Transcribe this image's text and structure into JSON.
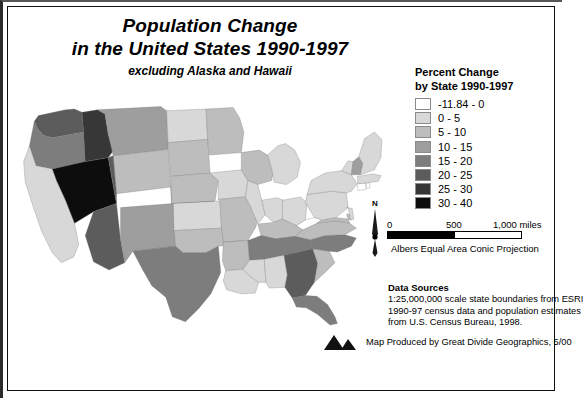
{
  "title": {
    "line1": "Population Change",
    "line2": "in the United States 1990-1997",
    "subtitle": "excluding Alaska and Hawaii"
  },
  "legend": {
    "title_line1": "Percent Change",
    "title_line2": "by State 1990-1997",
    "classes": [
      {
        "label": "-11.84 - 0",
        "color": "#ffffff"
      },
      {
        "label": "0 - 5",
        "color": "#d8d8d8"
      },
      {
        "label": "5 - 10",
        "color": "#bdbdbd"
      },
      {
        "label": "10 - 15",
        "color": "#9e9e9e"
      },
      {
        "label": "15 - 20",
        "color": "#7d7d7d"
      },
      {
        "label": "20 - 25",
        "color": "#5c5c5c"
      },
      {
        "label": "25 - 30",
        "color": "#373737"
      },
      {
        "label": "30 - 40",
        "color": "#0d0d0d"
      }
    ]
  },
  "north_arrow": {
    "label": "N"
  },
  "scalebar": {
    "tick_0": "0",
    "tick_mid": "500",
    "tick_max": "1,000 miles",
    "projection": "Albers Equal Area Conic Projection"
  },
  "data_sources": {
    "heading": "Data Sources",
    "line1": "1:25,000,000 scale state boundaries from ESRI",
    "line2": "1990-97 census data and population estimates",
    "line3": "from U.S. Census Bureau, 1998."
  },
  "credit": {
    "text": "Map Produced by Great Divide Geographics, 5/00"
  },
  "chart_data": {
    "type": "map",
    "title": "Population Change in the United States 1990-1997",
    "subtitle": "excluding Alaska and Hawaii",
    "unit": "percent change",
    "classes": [
      "-11.84 - 0",
      "0 - 5",
      "5 - 10",
      "10 - 15",
      "15 - 20",
      "20 - 25",
      "25 - 30",
      "30 - 40"
    ],
    "class_colors": [
      "#ffffff",
      "#d8d8d8",
      "#bdbdbd",
      "#9e9e9e",
      "#7d7d7d",
      "#5c5c5c",
      "#373737",
      "#0d0d0d"
    ],
    "states": [
      {
        "code": "WA",
        "name": "Washington",
        "class": 5,
        "color": "#5c5c5c"
      },
      {
        "code": "OR",
        "name": "Oregon",
        "class": 4,
        "color": "#7d7d7d"
      },
      {
        "code": "CA",
        "name": "California",
        "class": 1,
        "color": "#d8d8d8"
      },
      {
        "code": "ID",
        "name": "Idaho",
        "class": 6,
        "color": "#373737"
      },
      {
        "code": "NV",
        "name": "Nevada",
        "class": 7,
        "color": "#0d0d0d"
      },
      {
        "code": "MT",
        "name": "Montana",
        "class": 3,
        "color": "#9e9e9e"
      },
      {
        "code": "WY",
        "name": "Wyoming",
        "class": 2,
        "color": "#bdbdbd"
      },
      {
        "code": "UT",
        "name": "Utah",
        "class": 5,
        "color": "#5c5c5c"
      },
      {
        "code": "AZ",
        "name": "Arizona",
        "class": 5,
        "color": "#5c5c5c"
      },
      {
        "code": "CO",
        "name": "Colorado",
        "class": 4,
        "color": "#7d7d7d"
      },
      {
        "code": "NM",
        "name": "New Mexico",
        "class": 3,
        "color": "#9e9e9e"
      },
      {
        "code": "ND",
        "name": "North Dakota",
        "class": 1,
        "color": "#d8d8d8"
      },
      {
        "code": "SD",
        "name": "South Dakota",
        "class": 2,
        "color": "#bdbdbd"
      },
      {
        "code": "NE",
        "name": "Nebraska",
        "class": 2,
        "color": "#bdbdbd"
      },
      {
        "code": "KS",
        "name": "Kansas",
        "class": 1,
        "color": "#d8d8d8"
      },
      {
        "code": "OK",
        "name": "Oklahoma",
        "class": 2,
        "color": "#bdbdbd"
      },
      {
        "code": "TX",
        "name": "Texas",
        "class": 4,
        "color": "#7d7d7d"
      },
      {
        "code": "MN",
        "name": "Minnesota",
        "class": 2,
        "color": "#bdbdbd"
      },
      {
        "code": "IA",
        "name": "Iowa",
        "class": 1,
        "color": "#d8d8d8"
      },
      {
        "code": "MO",
        "name": "Missouri",
        "class": 2,
        "color": "#bdbdbd"
      },
      {
        "code": "AR",
        "name": "Arkansas",
        "class": 2,
        "color": "#bdbdbd"
      },
      {
        "code": "LA",
        "name": "Louisiana",
        "class": 1,
        "color": "#d8d8d8"
      },
      {
        "code": "WI",
        "name": "Wisconsin",
        "class": 2,
        "color": "#bdbdbd"
      },
      {
        "code": "IL",
        "name": "Illinois",
        "class": 1,
        "color": "#d8d8d8"
      },
      {
        "code": "MI",
        "name": "Michigan",
        "class": 1,
        "color": "#d8d8d8"
      },
      {
        "code": "IN",
        "name": "Indiana",
        "class": 1,
        "color": "#d8d8d8"
      },
      {
        "code": "OH",
        "name": "Ohio",
        "class": 1,
        "color": "#d8d8d8"
      },
      {
        "code": "KY",
        "name": "Kentucky",
        "class": 2,
        "color": "#bdbdbd"
      },
      {
        "code": "TN",
        "name": "Tennessee",
        "class": 4,
        "color": "#7d7d7d"
      },
      {
        "code": "MS",
        "name": "Mississippi",
        "class": 1,
        "color": "#d8d8d8"
      },
      {
        "code": "AL",
        "name": "Alabama",
        "class": 1,
        "color": "#d8d8d8"
      },
      {
        "code": "GA",
        "name": "Georgia",
        "class": 5,
        "color": "#5c5c5c"
      },
      {
        "code": "FL",
        "name": "Florida",
        "class": 4,
        "color": "#7d7d7d"
      },
      {
        "code": "SC",
        "name": "South Carolina",
        "class": 2,
        "color": "#bdbdbd"
      },
      {
        "code": "NC",
        "name": "North Carolina",
        "class": 4,
        "color": "#7d7d7d"
      },
      {
        "code": "VA",
        "name": "Virginia",
        "class": 2,
        "color": "#bdbdbd"
      },
      {
        "code": "WV",
        "name": "West Virginia",
        "class": 0,
        "color": "#ffffff"
      },
      {
        "code": "MD",
        "name": "Maryland",
        "class": 2,
        "color": "#bdbdbd"
      },
      {
        "code": "DE",
        "name": "Delaware",
        "class": 2,
        "color": "#bdbdbd"
      },
      {
        "code": "PA",
        "name": "Pennsylvania",
        "class": 1,
        "color": "#d8d8d8"
      },
      {
        "code": "NJ",
        "name": "New Jersey",
        "class": 1,
        "color": "#d8d8d8"
      },
      {
        "code": "NY",
        "name": "New York",
        "class": 1,
        "color": "#d8d8d8"
      },
      {
        "code": "CT",
        "name": "Connecticut",
        "class": 0,
        "color": "#ffffff"
      },
      {
        "code": "RI",
        "name": "Rhode Island",
        "class": 0,
        "color": "#ffffff"
      },
      {
        "code": "MA",
        "name": "Massachusetts",
        "class": 1,
        "color": "#d8d8d8"
      },
      {
        "code": "VT",
        "name": "Vermont",
        "class": 1,
        "color": "#d8d8d8"
      },
      {
        "code": "NH",
        "name": "New Hampshire",
        "class": 3,
        "color": "#9e9e9e"
      },
      {
        "code": "ME",
        "name": "Maine",
        "class": 1,
        "color": "#d8d8d8"
      }
    ]
  }
}
